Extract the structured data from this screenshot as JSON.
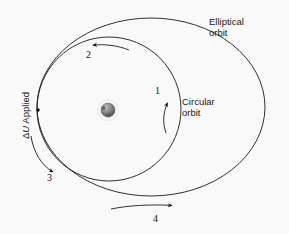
{
  "figure": {
    "background_color": "#f9f9f9",
    "stroke_color": "#1a1a1a"
  },
  "labels": {
    "elliptical_orbit_line1": "Elliptical",
    "elliptical_orbit_line2": "orbit",
    "circular_orbit_line1": "Circular",
    "circular_orbit_line2": "orbit",
    "delta_u_prefix": "Δ",
    "delta_u_symbol": "U",
    "delta_u_suffix": " Applied"
  },
  "markers": {
    "step_1": "1",
    "step_2": "2",
    "step_3": "3",
    "step_4": "4"
  },
  "bodies": {
    "central_body": "planet",
    "burn_point": "delta-v-application-point"
  },
  "geometry": {
    "circular_orbit": {
      "cx": 109,
      "cy": 109,
      "r": 72
    },
    "elliptical_orbit": {
      "cx": 151,
      "cy": 107,
      "rx": 114,
      "ry": 89
    },
    "planet": {
      "cx": 108,
      "cy": 110,
      "r": 7
    },
    "burn_dot": {
      "cx": 38,
      "cy": 110,
      "r": 1.6
    }
  }
}
